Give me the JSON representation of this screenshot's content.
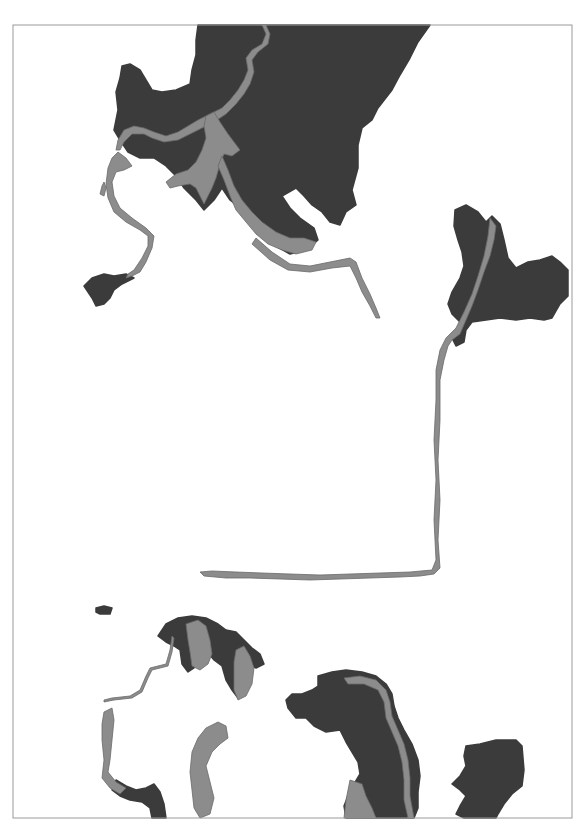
{
  "map": {
    "width": 587,
    "height": 836,
    "colors": {
      "background": "#ffffff",
      "frame": "#9a9a9a",
      "watershed": "#3b3b3b",
      "river": "#8c8c8c",
      "river_outline": "#6a6a6a"
    },
    "frame": {
      "x": 13,
      "y": 25,
      "width": 559,
      "height": 793
    },
    "watersheds": [
      {
        "name": "north-watershed",
        "d": "M198 25 L430 25 L418 42 L410 58 L400 75 L392 90 L378 108 L372 120 L362 128 L358 145 L358 168 L352 190 L356 205 L346 212 L340 225 L330 222 L322 212 L312 205 L304 196 L296 188 L282 196 L290 208 L300 218 L314 228 L318 240 L306 250 L290 254 L276 246 L262 234 L250 222 L240 208 L230 200 L222 188 L214 200 L204 210 L196 200 L184 188 L176 176 L166 166 L154 158 L140 158 L128 152 L120 140 L114 130 L118 110 L116 92 L120 78 L122 66 L130 64 L140 70 L146 80 L152 90 L162 92 L176 90 L190 84 L192 70 L196 55 L196 40 Z"
      },
      {
        "name": "northeast-watershed",
        "d": "M455 210 L466 205 L478 212 L486 222 L492 216 L500 224 L504 240 L508 258 L516 268 L528 262 L540 260 L552 256 L560 262 L568 270 L568 296 L560 304 L552 318 L544 320 L530 318 L516 320 L500 318 L486 320 L472 322 L466 330 L464 342 L456 346 L452 338 L458 330 L460 322 L452 314 L448 304 L452 292 L460 278 L464 266 L462 252 L458 240 L454 226 Z"
      },
      {
        "name": "west-small-watershed",
        "d": "M92 278 L104 274 L114 276 L126 274 L134 278 L122 284 L114 290 L110 298 L104 304 L96 306 L92 298 L88 292 L84 286 Z"
      },
      {
        "name": "southwest-islet",
        "d": "M96 608 L104 606 L112 608 L110 614 L100 614 L96 612 Z"
      },
      {
        "name": "south-central-watershed",
        "d": "M318 676 L332 672 L346 670 L362 672 L376 676 L386 684 L392 694 L394 706 L398 718 L404 730 L412 744 L418 760 L420 776 L418 792 L418 808 L414 818 L346 818 L344 806 L348 796 L354 784 L360 774 L358 762 L352 752 L346 742 L340 730 L326 732 L314 726 L306 718 L296 718 L288 708 L286 700 L292 694 L302 694 L312 690 L318 686 Z"
      },
      {
        "name": "southeast-watershed",
        "d": "M466 746 L480 744 L496 740 L516 740 L522 746 L524 770 L522 786 L512 794 L504 804 L498 814 L496 818 L464 818 L456 814 L460 806 L466 796 L460 790 L452 784 L460 776 L466 766 L464 756 Z"
      },
      {
        "name": "southwest-lake-fringe",
        "d": "M158 636 L166 624 L178 618 L192 616 L206 618 L218 624 L226 630 L236 632 L244 640 L252 648 L260 654 L264 664 L256 668 L248 664 L246 676 L244 690 L238 698 L232 690 L226 680 L222 666 L214 660 L206 650 L198 652 L194 668 L188 672 L182 664 L180 650 L174 646 L166 642 Z"
      },
      {
        "name": "southwest-coast-fringe",
        "d": "M116 780 L126 786 L136 790 L146 788 L154 784 L160 792 L164 804 L166 818 L152 818 L150 808 L142 802 L130 800 L120 796 L112 790 Z"
      }
    ],
    "rivers": [
      {
        "name": "north-main-river",
        "d": "M262 25 L266 34 L262 44 L252 50 L246 58 L248 70 L244 80 L238 90 L230 100 L222 108 L210 114 L198 120 L188 126 L178 132 L166 136 L154 132 L144 128 L134 126 L124 130 L118 140 L116 150 L120 150 L124 142 L132 134 L144 134 L152 138 L164 142 L178 140 L190 134 L202 128 L214 122 L226 114 L236 104 L244 94 L250 84 L254 72 L252 60 L258 52 L268 44 L270 34 L266 25 Z"
      },
      {
        "name": "north-lake",
        "d": "M206 116 L214 112 L220 122 L228 134 L234 142 L240 150 L232 156 L224 154 L220 164 L216 178 L212 188 L208 196 L204 204 L200 196 L196 188 L190 184 L178 186 L170 188 L166 182 L176 174 L188 170 L196 162 L202 150 L206 138 L204 126 Z"
      },
      {
        "name": "north-east-channel",
        "d": "M222 156 L228 170 L234 186 L242 200 L252 212 L262 222 L276 232 L290 238 L304 238 L316 242 L312 250 L296 254 L282 250 L268 244 L256 234 L246 222 L236 210 L230 196 L224 180 L218 166 Z"
      },
      {
        "name": "north-east-long-channel",
        "d": "M256 238 L272 252 L290 264 L310 266 L330 262 L350 258 L356 262 L362 278 L370 294 L376 308 L380 318 L376 318 L370 306 L362 292 L356 278 L350 266 L332 268 L310 272 L288 270 L270 260 L252 244 Z"
      },
      {
        "name": "west-coast-river",
        "d": "M118 152 L126 158 L132 166 L124 170 L116 172 L112 182 L114 196 L120 208 L132 218 L146 228 L154 236 L152 248 L146 262 L140 272 L132 276 L126 278 L128 274 L134 270 L142 258 L148 246 L148 236 L140 230 L126 222 L114 212 L108 198 L106 184 L108 168 L112 158 Z"
      },
      {
        "name": "west-coast-sliver",
        "d": "M102 186 L104 182 L106 188 L104 196 L100 194 Z"
      },
      {
        "name": "northeast-river",
        "d": "M490 218 L496 226 L494 240 L490 256 L484 272 L478 290 L472 306 L466 320 L460 334 L452 340 L448 346 L444 360 L440 380 L440 420 L438 460 L440 500 L438 540 L440 568 L434 574 L420 576 L400 577 L370 578 L340 579 L310 580 L280 579 L250 578 L226 578 L204 576 L200 572 L212 571 L236 572 L262 573 L290 574 L320 575 L350 574 L380 573 L410 572 L432 570 L436 560 L434 520 L436 480 L434 440 L436 400 L436 370 L440 350 L446 338 L456 328 L464 312 L472 294 L478 276 L484 256 L488 236 Z"
      },
      {
        "name": "southwest-lake-north",
        "d": "M186 624 L198 620 L206 626 L210 640 L212 654 L208 664 L200 670 L192 666 L190 652 L188 640 Z"
      },
      {
        "name": "southwest-lake-east",
        "d": "M236 650 L244 646 L250 656 L254 668 L252 684 L246 696 L238 700 L234 690 L234 676 L234 662 Z"
      },
      {
        "name": "southwest-lake-west",
        "d": "M104 712 L112 708 L114 720 L112 740 L110 760 L108 772 L116 782 L126 788 L120 794 L110 788 L102 778 L104 760 L102 740 L102 724 Z"
      },
      {
        "name": "southwest-lake-south",
        "d": "M206 728 L218 722 L226 726 L228 738 L220 744 L212 752 L206 766 L210 782 L214 798 L210 814 L200 818 L194 808 L192 790 L190 772 L192 752 L198 738 Z"
      },
      {
        "name": "southwest-connector",
        "d": "M172 636 L170 650 L166 664 L150 668 L146 676 L140 690 L130 696 L112 698 L104 700 L104 702 L114 700 L132 698 L142 692 L148 678 L152 670 L168 666 L172 652 L174 638 Z"
      },
      {
        "name": "south-central-river",
        "d": "M344 678 L360 676 L376 680 L386 690 L390 702 L392 716 L398 730 L404 744 L408 760 L410 778 L410 796 L414 818 L408 818 L404 800 L404 780 L402 762 L398 746 L392 732 L386 718 L384 702 L378 690 L364 684 L348 684 Z"
      },
      {
        "name": "south-central-lake",
        "d": "M350 780 L362 784 L366 796 L372 808 L376 818 L344 818 L346 800 Z"
      }
    ]
  }
}
